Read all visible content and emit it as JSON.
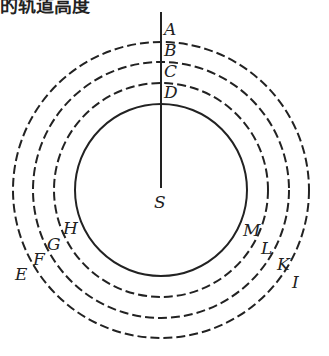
{
  "caption": "的轨道高度",
  "diagram": {
    "center": {
      "x": 161,
      "y": 190,
      "label": "S"
    },
    "axis": {
      "x": 161,
      "y_top": 12,
      "y_bottom": 188
    },
    "stroke_color": "#222222",
    "circles": [
      {
        "name": "outer-orbit",
        "r": 148,
        "style": "dashed",
        "top_label": "A",
        "left_label": "E",
        "right_label": "I"
      },
      {
        "name": "second-orbit",
        "r": 128,
        "style": "dashed",
        "top_label": "B",
        "left_label": "F",
        "right_label": "K"
      },
      {
        "name": "third-orbit",
        "r": 107,
        "style": "dashed",
        "top_label": "C",
        "left_label": "G",
        "right_label": "L"
      },
      {
        "name": "inner-orbit",
        "r": 86,
        "style": "solid",
        "top_label": "D",
        "left_label": "H",
        "right_label": "M"
      }
    ],
    "labels": {
      "A": "A",
      "B": "B",
      "C": "C",
      "D": "D",
      "E": "E",
      "F": "F",
      "G": "G",
      "H": "H",
      "I": "I",
      "K": "K",
      "L": "L",
      "M": "M",
      "S": "S"
    }
  }
}
